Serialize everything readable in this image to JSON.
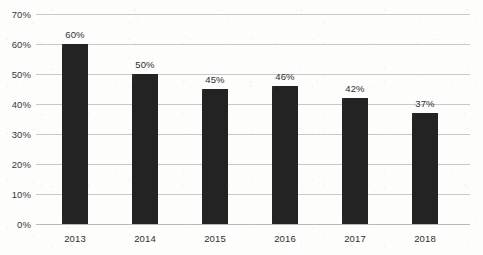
{
  "chart_data": {
    "type": "bar",
    "title": "",
    "subtitle": "",
    "xlabel": "",
    "ylabel": "",
    "categories": [
      "2013",
      "2014",
      "2015",
      "2016",
      "2017",
      "2018"
    ],
    "values": [
      60,
      50,
      45,
      46,
      42,
      37
    ],
    "data_labels": [
      "60%",
      "50%",
      "45%",
      "46%",
      "42%",
      "37%"
    ],
    "ylim": [
      0,
      70
    ],
    "ytick_step": 10,
    "ytick_labels": [
      "0%",
      "10%",
      "20%",
      "30%",
      "40%",
      "50%",
      "60%",
      "70%"
    ],
    "ytick_values": [
      0,
      10,
      20,
      30,
      40,
      50,
      60,
      70
    ],
    "grid": true,
    "grid_axis": "y",
    "legend": false,
    "legend_position": "none",
    "series": [
      {
        "name": "",
        "values": [
          60,
          50,
          45,
          46,
          42,
          37
        ]
      }
    ],
    "colors": {
      "bar": "#232323",
      "gridline": "#c8c9ca",
      "axis": "#b9babb",
      "text": "#2c2f31",
      "background": "#fdfdfc"
    }
  }
}
